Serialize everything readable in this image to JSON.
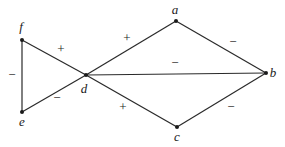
{
  "diagram": {
    "type": "signed-graph",
    "nodes": [
      {
        "id": "a",
        "label": "a",
        "x": 176,
        "y": 21,
        "lx": 175,
        "ly": 14
      },
      {
        "id": "b",
        "label": "b",
        "x": 266,
        "y": 73,
        "lx": 273,
        "ly": 77
      },
      {
        "id": "c",
        "label": "c",
        "x": 177,
        "y": 127,
        "lx": 177,
        "ly": 141
      },
      {
        "id": "d",
        "label": "d",
        "x": 86,
        "y": 75,
        "lx": 84,
        "ly": 93
      },
      {
        "id": "e",
        "label": "e",
        "x": 22,
        "y": 112,
        "lx": 22,
        "ly": 126
      },
      {
        "id": "f",
        "label": "f",
        "x": 22,
        "y": 40,
        "lx": 21,
        "ly": 31
      }
    ],
    "edges": [
      {
        "from": "f",
        "to": "d",
        "sign": "+",
        "sx": 61,
        "sy": 53
      },
      {
        "from": "e",
        "to": "d",
        "sign": "−",
        "sx": 57,
        "sy": 102
      },
      {
        "from": "f",
        "to": "e",
        "sign": "−",
        "sx": 12,
        "sy": 79
      },
      {
        "from": "d",
        "to": "a",
        "sign": "+",
        "sx": 127,
        "sy": 42
      },
      {
        "from": "d",
        "to": "c",
        "sign": "+",
        "sx": 123,
        "sy": 111
      },
      {
        "from": "d",
        "to": "b",
        "sign": "−",
        "sx": 175,
        "sy": 67
      },
      {
        "from": "a",
        "to": "b",
        "sign": "−",
        "sx": 233,
        "sy": 46
      },
      {
        "from": "c",
        "to": "b",
        "sign": "−",
        "sx": 231,
        "sy": 111
      }
    ]
  }
}
